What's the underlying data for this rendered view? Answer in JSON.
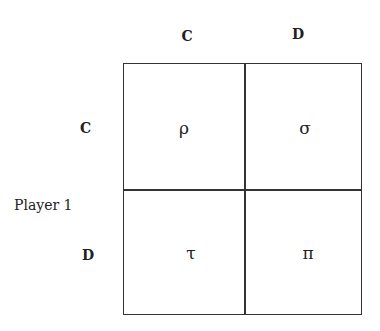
{
  "columns": [
    "C",
    "D"
  ],
  "rows": [
    "C",
    "D"
  ],
  "row_player": "Player 1",
  "payoffs": [
    [
      "ρ",
      "σ"
    ],
    [
      "τ",
      "π"
    ]
  ]
}
